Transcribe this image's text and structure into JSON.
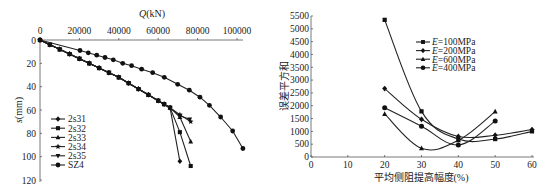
{
  "chart_data": [
    {
      "type": "line",
      "title": "",
      "xlabel": "Q(kN)",
      "ylabel": "s(mm)",
      "x_axis_position": "top",
      "y_inverted": true,
      "xlim": [
        0,
        105000
      ],
      "ylim": [
        0,
        120
      ],
      "xticks": [
        0,
        20000,
        40000,
        60000,
        80000,
        100000
      ],
      "yticks": [
        0,
        20,
        40,
        60,
        80,
        100,
        120
      ],
      "grid": false,
      "legend_position": "lower-left",
      "series": [
        {
          "name": "2s31",
          "marker": "diamond",
          "points": [
            [
              0,
              0
            ],
            [
              5000,
              4
            ],
            [
              10000,
              8
            ],
            [
              15000,
              12
            ],
            [
              20000,
              16
            ],
            [
              25000,
              20
            ],
            [
              30000,
              24
            ],
            [
              35000,
              28
            ],
            [
              40000,
              32
            ],
            [
              45000,
              37
            ],
            [
              50000,
              42
            ],
            [
              55000,
              47
            ],
            [
              60000,
              52
            ],
            [
              63000,
              55
            ],
            [
              66000,
              58
            ],
            [
              71000,
              104
            ]
          ]
        },
        {
          "name": "2s32",
          "marker": "square",
          "points": [
            [
              0,
              0
            ],
            [
              5000,
              4
            ],
            [
              10000,
              8
            ],
            [
              15000,
              12
            ],
            [
              20000,
              16
            ],
            [
              25000,
              20
            ],
            [
              30000,
              24
            ],
            [
              35000,
              28
            ],
            [
              40000,
              32
            ],
            [
              45000,
              37
            ],
            [
              50000,
              42
            ],
            [
              55000,
              47
            ],
            [
              60000,
              52
            ],
            [
              63000,
              55
            ],
            [
              66000,
              58
            ],
            [
              71000,
              79
            ],
            [
              76500,
              108
            ]
          ]
        },
        {
          "name": "2s33",
          "marker": "triangle",
          "points": [
            [
              0,
              0
            ],
            [
              5000,
              4
            ],
            [
              10000,
              8
            ],
            [
              15000,
              12
            ],
            [
              20000,
              16
            ],
            [
              25000,
              20
            ],
            [
              30000,
              24
            ],
            [
              35000,
              28
            ],
            [
              40000,
              32
            ],
            [
              45000,
              37
            ],
            [
              50000,
              42
            ],
            [
              55000,
              47
            ],
            [
              60000,
              52
            ],
            [
              63000,
              55
            ],
            [
              66000,
              58
            ],
            [
              71000,
              66
            ],
            [
              76500,
              87
            ]
          ]
        },
        {
          "name": "2s34",
          "marker": "star",
          "points": [
            [
              0,
              0
            ],
            [
              5000,
              4
            ],
            [
              10000,
              8
            ],
            [
              15000,
              12
            ],
            [
              20000,
              16
            ],
            [
              25000,
              20
            ],
            [
              30000,
              24
            ],
            [
              35000,
              28
            ],
            [
              40000,
              32
            ],
            [
              45000,
              37
            ],
            [
              50000,
              42
            ],
            [
              55000,
              47
            ],
            [
              60000,
              52
            ],
            [
              63000,
              55
            ],
            [
              66000,
              58
            ],
            [
              71000,
              64
            ],
            [
              76500,
              70
            ]
          ]
        },
        {
          "name": "2s35",
          "marker": "triangle-down",
          "points": [
            [
              0,
              0
            ],
            [
              5000,
              4
            ],
            [
              10000,
              8
            ],
            [
              15000,
              12
            ],
            [
              20000,
              16
            ],
            [
              25000,
              20
            ],
            [
              30000,
              24
            ],
            [
              35000,
              28
            ],
            [
              40000,
              32
            ],
            [
              45000,
              37
            ],
            [
              50000,
              42
            ],
            [
              55000,
              47
            ],
            [
              60000,
              52
            ],
            [
              63000,
              55
            ],
            [
              66000,
              58
            ],
            [
              71000,
              65
            ],
            [
              76000,
              68
            ]
          ]
        },
        {
          "name": "SZ4",
          "marker": "circle",
          "points": [
            [
              0,
              0
            ],
            [
              20300,
              9
            ],
            [
              24500,
              11
            ],
            [
              28800,
              13
            ],
            [
              33000,
              15
            ],
            [
              37200,
              17
            ],
            [
              42000,
              20
            ],
            [
              46500,
              22
            ],
            [
              51600,
              25
            ],
            [
              57200,
              28
            ],
            [
              63100,
              32
            ],
            [
              69900,
              38
            ],
            [
              75800,
              43
            ],
            [
              81200,
              49
            ],
            [
              86000,
              56
            ],
            [
              91700,
              66
            ],
            [
              97800,
              78
            ],
            [
              103000,
              93
            ]
          ]
        }
      ]
    },
    {
      "type": "line",
      "title": "",
      "xlabel": "平均侧阻提高幅度(%)",
      "ylabel": "误差平方和",
      "xlim": [
        0,
        60
      ],
      "ylim": [
        0,
        5500
      ],
      "xticks": [
        0,
        10,
        20,
        30,
        40,
        50,
        60
      ],
      "yticks": [
        0,
        500,
        1000,
        1500,
        2000,
        2500,
        3000,
        3500,
        4000,
        4500,
        5000,
        5500
      ],
      "grid": false,
      "legend_position": "upper-right",
      "smooth": true,
      "series": [
        {
          "name": "E=100MPa",
          "marker": "square",
          "x": [
            20,
            30,
            40,
            50,
            60
          ],
          "values": [
            5350,
            1780,
            700,
            700,
            1000
          ]
        },
        {
          "name": "E=200MPa",
          "marker": "diamond",
          "x": [
            20,
            30,
            40,
            50,
            60
          ],
          "values": [
            2670,
            1470,
            800,
            850,
            1070
          ]
        },
        {
          "name": "E=600MPa",
          "marker": "triangle",
          "x": [
            20,
            30,
            40,
            50
          ],
          "values": [
            1680,
            340,
            650,
            1770
          ]
        },
        {
          "name": "E=400MPa",
          "marker": "circle",
          "x": [
            20,
            30,
            40,
            50
          ],
          "values": [
            1920,
            1200,
            470,
            1400
          ]
        }
      ]
    }
  ],
  "left": {
    "xlabel_italic": "Q",
    "xlabel_rest": "(kN)",
    "ylabel_italic": "s",
    "ylabel_rest": "(mm)",
    "legend": [
      "2s31",
      "2s32",
      "2s33",
      "2s34",
      "2s35",
      "SZ4"
    ]
  },
  "right": {
    "xlabel": "平均侧阻提高幅度(%)",
    "ylabel": "误差平方和",
    "legend_prefix": "E",
    "legend_suffix": [
      "=100MPa",
      "=200MPa",
      "=600MPa",
      "=400MPa"
    ]
  }
}
